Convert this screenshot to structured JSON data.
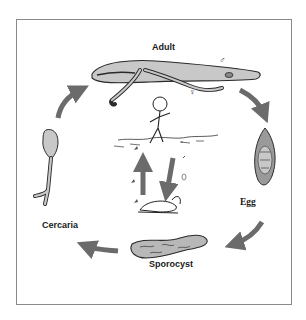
{
  "diagram": {
    "type": "life-cycle",
    "stages": [
      {
        "id": "adult",
        "label": "Adult",
        "sex_symbols": [
          "♂",
          "♀"
        ]
      },
      {
        "id": "egg",
        "label": "Egg"
      },
      {
        "id": "sporocyst",
        "label": "Sporocyst"
      },
      {
        "id": "cercaria",
        "label": "Cercaria"
      }
    ],
    "flow": [
      "Adult",
      "Egg",
      "Sporocyst",
      "Cercaria",
      "Adult"
    ],
    "center_scene": {
      "elements": [
        "human-wading-in-water",
        "water-surface",
        "swimming-cercariae",
        "miracidia",
        "snail-host"
      ],
      "inner_cycle_arrows": [
        "up",
        "down"
      ]
    },
    "colors": {
      "arrow": "#6b6b6b",
      "body_fill": "#c8c8c8",
      "outline": "#2a2a2a",
      "frame": "#8a8a8a"
    }
  }
}
